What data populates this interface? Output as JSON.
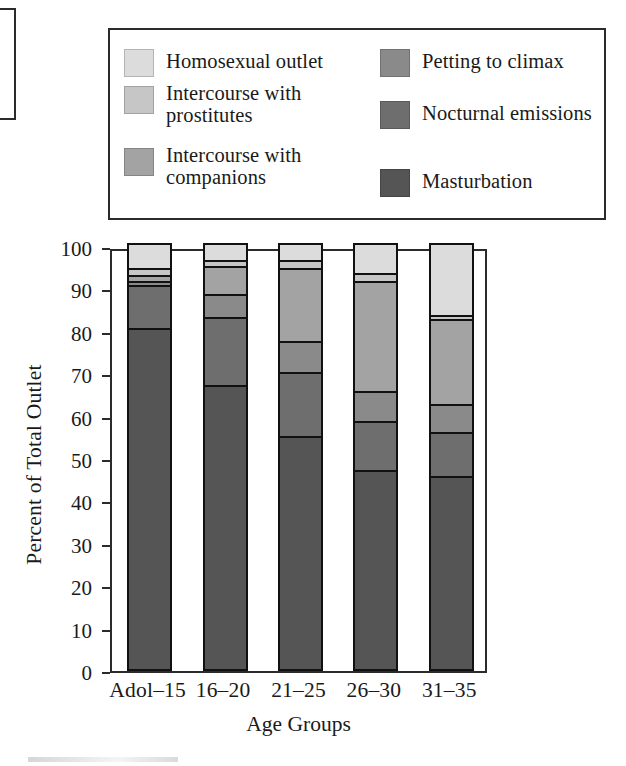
{
  "chart_data": {
    "type": "bar",
    "subtype": "stacked-bar-100",
    "title": "",
    "xlabel": "Age Groups",
    "ylabel": "Percent of Total Outlet",
    "ylim": [
      0,
      100
    ],
    "yticks": [
      0,
      10,
      20,
      30,
      40,
      50,
      60,
      70,
      80,
      90,
      100
    ],
    "grid": false,
    "legend_position": "top",
    "categories": [
      "Adol–15",
      "16–20",
      "21–25",
      "26–30",
      "31–35"
    ],
    "stack_order_bottom_to_top": [
      "Masturbation",
      "Nocturnal emissions",
      "Petting to climax",
      "Intercourse with companions",
      "Intercourse with prostitutes",
      "Homosexual outlet"
    ],
    "series": [
      {
        "name": "Masturbation",
        "color": "#555555",
        "values": [
          80.0,
          66.5,
          54.5,
          46.5,
          45.0
        ]
      },
      {
        "name": "Nocturnal emissions",
        "color": "#6e6e6e",
        "values": [
          10.0,
          16.0,
          15.0,
          11.5,
          10.5
        ]
      },
      {
        "name": "Petting to climax",
        "color": "#8a8a8a",
        "values": [
          1.0,
          5.5,
          7.5,
          7.0,
          6.5
        ]
      },
      {
        "name": "Intercourse with companions",
        "color": "#a3a3a3",
        "values": [
          1.5,
          6.5,
          17.0,
          26.0,
          20.0
        ]
      },
      {
        "name": "Intercourse with prostitutes",
        "color": "#c6c6c6",
        "values": [
          1.5,
          1.5,
          2.0,
          2.0,
          1.0
        ]
      },
      {
        "name": "Homosexual outlet",
        "color": "#dcdcdc",
        "values": [
          6.0,
          4.0,
          4.0,
          7.0,
          17.0
        ]
      }
    ],
    "cumulative_tops": [
      [
        80.0,
        90.0,
        91.0,
        92.5,
        94.0,
        100.0
      ],
      [
        66.5,
        82.5,
        88.0,
        94.5,
        96.0,
        100.0
      ],
      [
        54.5,
        69.5,
        77.0,
        94.0,
        96.0,
        100.0
      ],
      [
        46.5,
        58.0,
        65.0,
        91.0,
        93.0,
        100.0
      ],
      [
        45.0,
        55.5,
        62.0,
        82.0,
        83.0,
        100.0
      ]
    ]
  },
  "legend": {
    "entries": [
      {
        "label_line1": "Homosexual outlet",
        "label_line2": "",
        "color": "#dcdcdc",
        "name": "homosexual-outlet"
      },
      {
        "label_line1": "Petting to climax",
        "label_line2": "",
        "color": "#8a8a8a",
        "name": "petting-to-climax"
      },
      {
        "label_line1": "Intercourse with",
        "label_line2": "prostitutes",
        "color": "#c6c6c6",
        "name": "intercourse-with-prostitutes"
      },
      {
        "label_line1": "Nocturnal emissions",
        "label_line2": "",
        "color": "#6e6e6e",
        "name": "nocturnal-emissions"
      },
      {
        "label_line1": "Intercourse with",
        "label_line2": "companions",
        "color": "#a3a3a3",
        "name": "intercourse-with-companions"
      },
      {
        "label_line1": "Masturbation",
        "label_line2": "",
        "color": "#555555",
        "name": "masturbation"
      }
    ]
  }
}
